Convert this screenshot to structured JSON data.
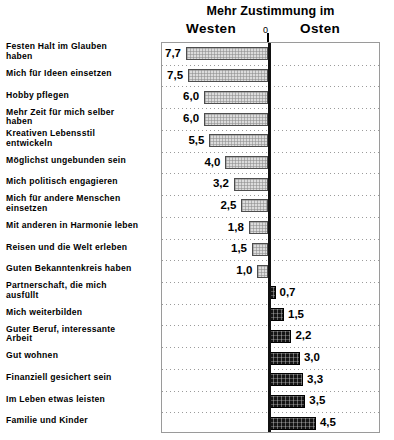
{
  "header": {
    "title": "Mehr Zustimmung im",
    "left_group": "Westen",
    "right_group": "Osten",
    "zero_label": "0"
  },
  "chart_data": {
    "type": "bar",
    "orientation": "horizontal",
    "title": "Mehr Zustimmung im",
    "xlabel": "",
    "ylabel": "",
    "xlim": [
      -8,
      5
    ],
    "grid": true,
    "legend_position": "top",
    "axis_zero_label": "0",
    "series": [
      {
        "name": "Westen",
        "side": "left",
        "fill": "light-gray-crosshatch"
      },
      {
        "name": "Osten",
        "side": "right",
        "fill": "dark-crosshatch"
      }
    ],
    "categories": [
      "Festen Halt im Glauben haben",
      "Mich für Ideen einsetzen",
      "Hobby pflegen",
      "Mehr Zeit für mich selber haben",
      "Kreativen Lebensstil entwickeln",
      "Möglichst ungebunden sein",
      "Mich politisch engagieren",
      "Mich für andere Menschen einsetzen",
      "Mit anderen in Harmonie leben",
      "Reisen und die Welt erleben",
      "Guten Bekanntenkreis haben",
      "Partnerschaft, die mich ausfüllt",
      "Mich weiterbilden",
      "Guter Beruf, interessante Arbeit",
      "Gut wohnen",
      "Finanziell gesichert sein",
      "Im Leben etwas leisten",
      "Familie und Kinder"
    ],
    "values": [
      7.7,
      7.5,
      6.0,
      6.0,
      5.5,
      4.0,
      3.2,
      2.5,
      1.8,
      1.5,
      1.0,
      0.7,
      1.5,
      2.2,
      3.0,
      3.3,
      3.5,
      4.5
    ],
    "value_labels": [
      "7,7",
      "7,5",
      "6,0",
      "6,0",
      "5,5",
      "4,0",
      "3,2",
      "2,5",
      "1,8",
      "1,5",
      "1,0",
      "0,7",
      "1,5",
      "2,2",
      "3,0",
      "3,3",
      "3,5",
      "4,5"
    ],
    "sides": [
      "left",
      "left",
      "left",
      "left",
      "left",
      "left",
      "left",
      "left",
      "left",
      "left",
      "left",
      "right",
      "right",
      "right",
      "right",
      "right",
      "right",
      "right"
    ]
  },
  "rows": [
    {
      "label_line1": "Festen Halt im Glauben",
      "label_line2": "haben",
      "value": "7,7",
      "num": 7.7,
      "side": "left"
    },
    {
      "label_line1": "Mich für Ideen einsetzen",
      "label_line2": "",
      "value": "7,5",
      "num": 7.5,
      "side": "left"
    },
    {
      "label_line1": "Hobby pflegen",
      "label_line2": "",
      "value": "6,0",
      "num": 6.0,
      "side": "left"
    },
    {
      "label_line1": "Mehr Zeit für mich selber",
      "label_line2": "haben",
      "value": "6,0",
      "num": 6.0,
      "side": "left"
    },
    {
      "label_line1": "Kreativen Lebensstil",
      "label_line2": "entwickeln",
      "value": "5,5",
      "num": 5.5,
      "side": "left"
    },
    {
      "label_line1": "Möglichst ungebunden sein",
      "label_line2": "",
      "value": "4,0",
      "num": 4.0,
      "side": "left"
    },
    {
      "label_line1": "Mich politisch engagieren",
      "label_line2": "",
      "value": "3,2",
      "num": 3.2,
      "side": "left"
    },
    {
      "label_line1": "Mich für andere Menschen",
      "label_line2": "einsetzen",
      "value": "2,5",
      "num": 2.5,
      "side": "left"
    },
    {
      "label_line1": "Mit anderen in Harmonie leben",
      "label_line2": "",
      "value": "1,8",
      "num": 1.8,
      "side": "left"
    },
    {
      "label_line1": "Reisen und die Welt erleben",
      "label_line2": "",
      "value": "1,5",
      "num": 1.5,
      "side": "left"
    },
    {
      "label_line1": "Guten Bekanntenkreis haben",
      "label_line2": "",
      "value": "1,0",
      "num": 1.0,
      "side": "left"
    },
    {
      "label_line1": "Partnerschaft, die mich",
      "label_line2": "ausfüllt",
      "value": "0,7",
      "num": 0.7,
      "side": "right"
    },
    {
      "label_line1": "Mich weiterbilden",
      "label_line2": "",
      "value": "1,5",
      "num": 1.5,
      "side": "right"
    },
    {
      "label_line1": "Guter Beruf, interessante",
      "label_line2": "Arbeit",
      "value": "2,2",
      "num": 2.2,
      "side": "right"
    },
    {
      "label_line1": "Gut wohnen",
      "label_line2": "",
      "value": "3,0",
      "num": 3.0,
      "side": "right"
    },
    {
      "label_line1": "Finanziell gesichert sein",
      "label_line2": "",
      "value": "3,3",
      "num": 3.3,
      "side": "right"
    },
    {
      "label_line1": "Im Leben etwas leisten",
      "label_line2": "",
      "value": "3,5",
      "num": 3.5,
      "side": "right"
    },
    {
      "label_line1": "Familie und Kinder",
      "label_line2": "",
      "value": "4,5",
      "num": 4.5,
      "side": "right"
    }
  ]
}
